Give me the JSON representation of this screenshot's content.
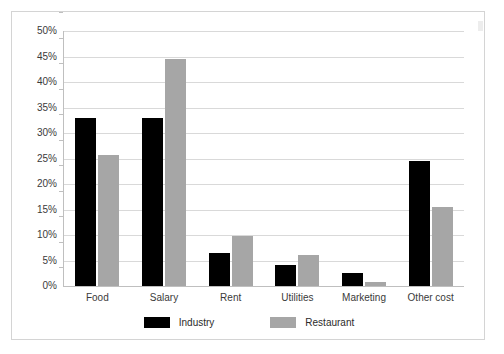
{
  "chart_data": {
    "type": "bar",
    "title": "",
    "subtitle": "",
    "xlabel": "",
    "ylabel": "",
    "ylim": [
      0,
      50
    ],
    "ytick_step": 5,
    "ytick_labels": [
      "50%",
      "45%",
      "40%",
      "35%",
      "30%",
      "25%",
      "20%",
      "15%",
      "10%",
      "5%",
      "0%"
    ],
    "ytick_values": [
      50,
      45,
      40,
      35,
      30,
      25,
      20,
      15,
      10,
      5,
      0
    ],
    "grid": true,
    "legend_position": "bottom",
    "value_suffix": "%",
    "categories": [
      "Food",
      "Salary",
      "Rent",
      "Utilities",
      "Marketing",
      "Other cost"
    ],
    "series": [
      {
        "name": "Industry",
        "color": "#000000",
        "values": [
          33.0,
          33.0,
          6.5,
          4.2,
          2.5,
          24.5
        ]
      },
      {
        "name": "Restaurant",
        "color": "#a6a6a6",
        "values": [
          25.7,
          44.5,
          9.8,
          6.1,
          0.8,
          15.5
        ]
      }
    ]
  },
  "frame": {
    "border_color": "#d4d4d4",
    "background": "#ffffff",
    "gridline_color": "#d9d9d9",
    "axis_color": "#bfbfbf"
  }
}
